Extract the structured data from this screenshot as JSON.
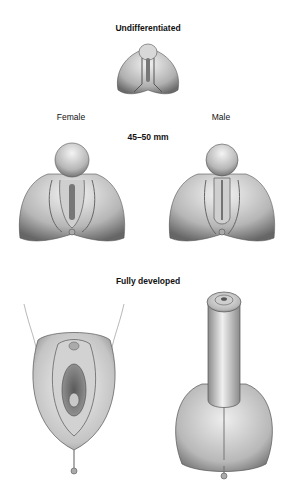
{
  "diagram": {
    "stages": [
      {
        "id": "undifferentiated",
        "title": "Undifferentiated"
      },
      {
        "id": "intermediate",
        "title": "45–50 mm",
        "panels": [
          {
            "label": "Female"
          },
          {
            "label": "Male"
          }
        ]
      },
      {
        "id": "fully-developed",
        "title": "Fully developed"
      }
    ],
    "colors": {
      "shade_dark": "#6e6e6e",
      "shade_mid": "#b4b4b4",
      "shade_light": "#ececec",
      "outline": "#3a3a3a"
    }
  }
}
